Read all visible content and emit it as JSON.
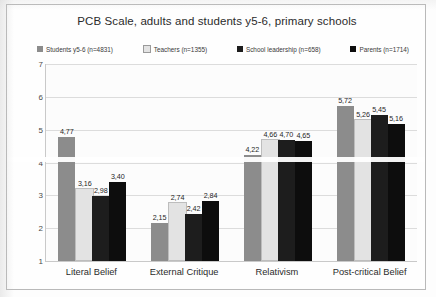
{
  "chart_data": {
    "type": "bar",
    "title": "PCB Scale, adults and students y5-6, primary schools",
    "xlabel": "",
    "ylabel": "",
    "ylim": [
      1,
      7
    ],
    "yticks": [
      "7",
      "6",
      "5",
      "4",
      "3",
      "2",
      "1"
    ],
    "grid": true,
    "legend_position": "top",
    "categories": [
      "Literal Belief",
      "External Critique",
      "Relativism",
      "Post-critical Belief"
    ],
    "series": [
      {
        "name": "Students y5-6 (n=4831)",
        "color": "#8c8c8c",
        "values": [
          4.77,
          2.15,
          4.22,
          5.72
        ],
        "labels": [
          "4,77",
          "2,15",
          "4,22",
          "5,72"
        ]
      },
      {
        "name": "Teachers (n=1355)",
        "color": "#e3e3e3",
        "values": [
          3.16,
          2.74,
          4.66,
          5.26
        ],
        "labels": [
          "3,16",
          "2,74",
          "4,66",
          "5,26"
        ]
      },
      {
        "name": "School leadership (n=658)",
        "color": "#1d1d1d",
        "values": [
          2.98,
          2.42,
          4.7,
          5.45
        ],
        "labels": [
          "2,98",
          "2,42",
          "4,70",
          "5,45"
        ]
      },
      {
        "name": "Parents (n=1714)",
        "color": "#0d0d0d",
        "values": [
          3.4,
          2.84,
          4.65,
          5.16
        ],
        "labels": [
          "3,40",
          "2,84",
          "4,65",
          "5,16"
        ]
      }
    ]
  }
}
